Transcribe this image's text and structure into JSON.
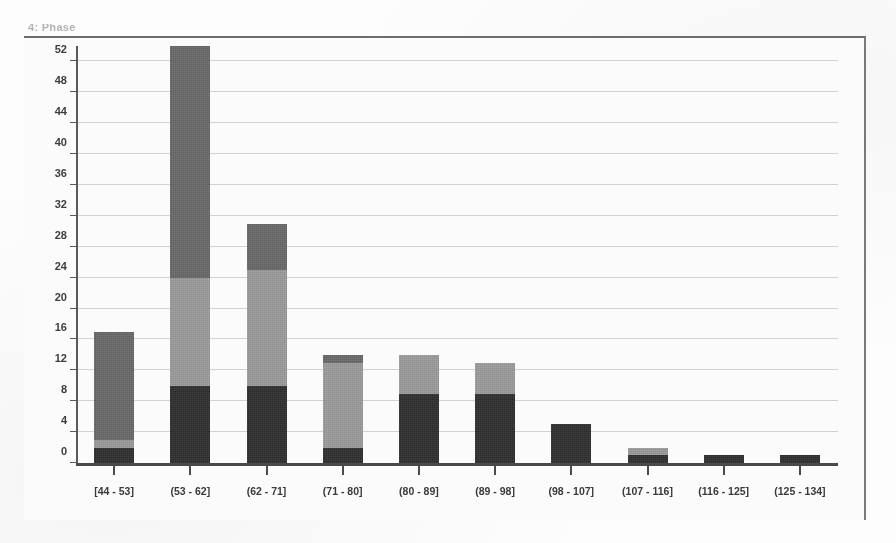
{
  "window": {
    "title": "4: Phase"
  },
  "chart_data": {
    "type": "bar",
    "title": "4: Phase",
    "subtype": "stacked-bar-histogram",
    "stacked": true,
    "xlabel": "",
    "ylabel": "",
    "grid": true,
    "legend_position": "none",
    "ylim": [
      0,
      54
    ],
    "yticks": [
      0,
      4,
      8,
      12,
      16,
      20,
      24,
      28,
      32,
      36,
      40,
      44,
      48,
      52
    ],
    "ytick_labels": [
      "0",
      "4",
      "8",
      "12",
      "16",
      "20",
      "24",
      "28",
      "32",
      "36",
      "40",
      "44",
      "48",
      "52"
    ],
    "categories": [
      "[44 - 53]",
      "(53 - 62]",
      "(62 - 71]",
      "(71 - 80]",
      "(80 - 89]",
      "(89 - 98]",
      "(98 - 107]",
      "(107 - 116]",
      "(116 - 125]",
      "(125 - 134]"
    ],
    "series": [
      {
        "name": "dark",
        "color": "#2e2e2e",
        "values": [
          2,
          10,
          10,
          2,
          9,
          9,
          5,
          1,
          1,
          1
        ]
      },
      {
        "name": "light-gray",
        "color": "#9a9a9a",
        "values": [
          1,
          14,
          15,
          11,
          5,
          4,
          0,
          1,
          0,
          0
        ]
      },
      {
        "name": "medium-gray",
        "color": "#686868",
        "values": [
          14,
          30,
          6,
          1,
          0,
          0,
          0,
          0,
          0,
          0
        ]
      }
    ],
    "totals": [
      17,
      54,
      31,
      14,
      14,
      13,
      5,
      2,
      1,
      1
    ]
  },
  "colors": {
    "dark": "#2e2e2e",
    "light_gray": "#9a9a9a",
    "medium_gray": "#686868",
    "gridline": "#c9c9c9",
    "axis": "#4a4a4a",
    "plot_background": "#fbfbfb"
  }
}
